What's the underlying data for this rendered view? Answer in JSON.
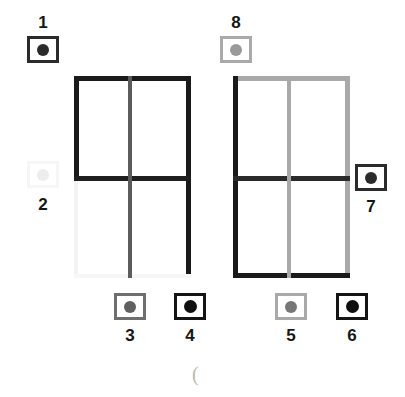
{
  "figure": {
    "caption_mark": "(",
    "colors": {
      "dark": "#1a1a1a",
      "mid_gray": "#5c5c5c",
      "light_gray": "#a9a9a9",
      "very_faint": "#f4f4f4",
      "faint_line": "#f2f2f2",
      "white": "#ffffff",
      "label_text": "#161616"
    },
    "left_panel": {
      "name": "left-grid",
      "segments": [
        {
          "id": "left-top-edge",
          "color": "#1a1a1a"
        },
        {
          "id": "left-upper-left-edge",
          "color": "#1a1a1a"
        },
        {
          "id": "left-lower-left-edge",
          "color": "#f4f4f4"
        },
        {
          "id": "left-right-edge",
          "color": "#1a1a1a"
        },
        {
          "id": "left-bottom-edge",
          "color": "#f7f7f7"
        },
        {
          "id": "left-crossbar",
          "color": "#1f1f1f"
        },
        {
          "id": "left-center-upright",
          "color": "#5c5c5c"
        }
      ]
    },
    "right_panel": {
      "name": "right-grid",
      "segments": [
        {
          "id": "right-top-edge",
          "color": "#a9a9a9"
        },
        {
          "id": "right-left-edge",
          "color": "#1a1a1a"
        },
        {
          "id": "right-right-edge",
          "color": "#a9a9a9"
        },
        {
          "id": "right-bottom-edge",
          "color": "#1a1a1a"
        },
        {
          "id": "right-crossbar",
          "color": "#2a2a2a"
        },
        {
          "id": "right-center-upright",
          "color": "#a9a9a9"
        }
      ]
    }
  },
  "markers": [
    {
      "id": "marker-1",
      "label": "1",
      "box_color": "#2b2b2b",
      "dot_color": "#2b2b2b",
      "label_position": "above"
    },
    {
      "id": "marker-2",
      "label": "2",
      "box_color": "#f6f6f6",
      "dot_color": "#ededed",
      "label_position": "below"
    },
    {
      "id": "marker-3",
      "label": "3",
      "box_color": "#6e6e6e",
      "dot_color": "#5f5f5f",
      "label_position": "below"
    },
    {
      "id": "marker-4",
      "label": "4",
      "box_color": "#141414",
      "dot_color": "#0f0f0f",
      "label_position": "below"
    },
    {
      "id": "marker-5",
      "label": "5",
      "box_color": "#a9a9a9",
      "dot_color": "#777777",
      "label_position": "below"
    },
    {
      "id": "marker-6",
      "label": "6",
      "box_color": "#141414",
      "dot_color": "#0f0f0f",
      "label_position": "below"
    },
    {
      "id": "marker-7",
      "label": "7",
      "box_color": "#2b2b2b",
      "dot_color": "#2b2b2b",
      "label_position": "below"
    },
    {
      "id": "marker-8",
      "label": "8",
      "box_color": "#a9a9a9",
      "dot_color": "#9a9a9a",
      "label_position": "above"
    }
  ]
}
